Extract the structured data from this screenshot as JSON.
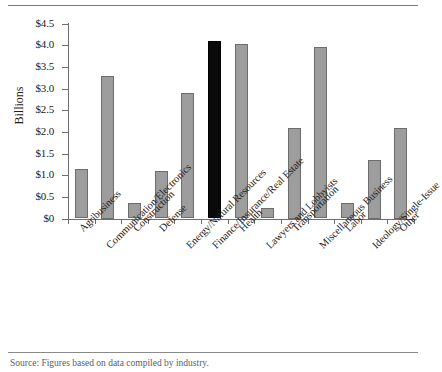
{
  "figure": {
    "y_axis_title": "Billions",
    "source_note": "Source: Figures based on data compiled by industry."
  },
  "chart_data": {
    "type": "bar",
    "title": "",
    "xlabel": "",
    "ylabel": "Billions",
    "ylim": [
      0,
      4.5
    ],
    "grid": false,
    "legend": "none",
    "ytick_labels": [
      "$0",
      "$0.5",
      "$1.0",
      "$1.5",
      "$2.0",
      "$2.5",
      "$3.0",
      "$3.5",
      "$4.0",
      "$4.5"
    ],
    "ytick_values": [
      0,
      0.5,
      1.0,
      1.5,
      2.0,
      2.5,
      3.0,
      3.5,
      4.0,
      4.5
    ],
    "categories": [
      "Agribusiness",
      "Communication/Electronics",
      "Construction",
      "Defense",
      "Energy/Natural Resources",
      "Finance/Insurance/Real Estate",
      "Health",
      "Lawyers and Lobbyists",
      "Transportation",
      "Miscellaneous Business",
      "Labor",
      "Ideology/Single-Issue",
      "Other"
    ],
    "values": [
      1.15,
      3.3,
      0.35,
      1.1,
      2.9,
      4.1,
      4.03,
      0.25,
      2.1,
      3.95,
      0.35,
      1.35,
      2.1
    ],
    "highlight_index": 5,
    "bar_color": "#9d9d9d",
    "bar_edge_color": "#6d6d6d",
    "highlight_color": "#0a0a0a"
  }
}
